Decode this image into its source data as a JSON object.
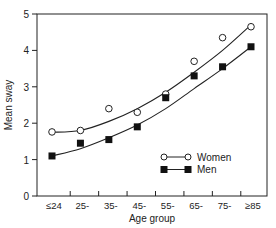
{
  "chart_data": {
    "type": "line",
    "title": "",
    "xlabel": "Age group",
    "ylabel": "Mean sway",
    "ylim": [
      0,
      5
    ],
    "yticks": [
      0,
      1,
      2,
      3,
      4,
      5
    ],
    "categories": [
      "≤24",
      "25-",
      "35-",
      "45-",
      "55-",
      "65-",
      "75-",
      "≥85"
    ],
    "grid": false,
    "legend_position": "lower right",
    "series": [
      {
        "name": "Women",
        "marker": "open-circle",
        "values": [
          1.76,
          1.8,
          2.4,
          2.3,
          2.8,
          3.7,
          4.35,
          4.65
        ],
        "fit_curve": [
          1.75,
          1.8,
          2.05,
          2.4,
          2.85,
          3.4,
          4.0,
          4.7
        ]
      },
      {
        "name": "Men",
        "marker": "filled-square",
        "values": [
          1.1,
          1.45,
          1.55,
          1.9,
          2.7,
          3.3,
          3.55,
          4.1
        ],
        "fit_curve": [
          1.1,
          1.3,
          1.6,
          1.95,
          2.4,
          2.95,
          3.5,
          4.1
        ]
      }
    ]
  }
}
